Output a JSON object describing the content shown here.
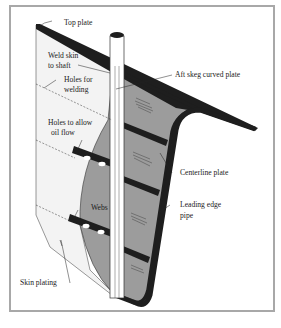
{
  "figure": {
    "type": "rudder structural diagram",
    "labels": {
      "top_plate": "Top plate",
      "weld_skin_line1": "Weld skin",
      "weld_skin_line2": "to shaft",
      "holes_welding_line1": "Holes for",
      "holes_welding_line2": "welding",
      "aft_skeg": "Aft skeg curved plate",
      "holes_oil_line1": "Holes to allow",
      "holes_oil_line2": "oil flow",
      "centerline_plate": "Centerline plate",
      "leading_edge_line1": "Leading edge",
      "leading_edge_line2": "pipe",
      "webs": "Webs",
      "skin_plating": "Skin plating"
    },
    "caption": "Figure caption (text cut off at bottom edge)",
    "colors": {
      "frame_border": "#a8a8a8",
      "dark_structure": "#1e1e1e",
      "web_fill": "#9a9a9a",
      "skin_fill": "#f2f2f2",
      "shaft_fill": "#ffffff"
    }
  }
}
